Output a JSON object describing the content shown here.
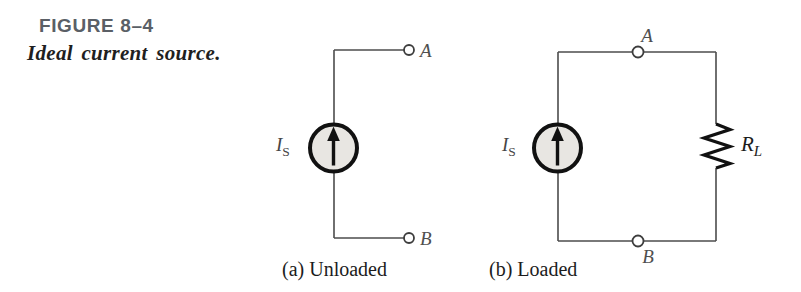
{
  "figure": {
    "label": "FIGURE 8–4",
    "title": "Ideal current source."
  },
  "circuits": {
    "a": {
      "caption": "(a) Unloaded",
      "terminal_top": "A",
      "terminal_bottom": "B",
      "source_label": {
        "main": "I",
        "sub": "S"
      }
    },
    "b": {
      "caption": "(b) Loaded",
      "terminal_top": "A",
      "terminal_bottom": "B",
      "source_label": {
        "main": "I",
        "sub": "S"
      },
      "resistor_label": {
        "main": "R",
        "sub": "L"
      }
    }
  },
  "colors": {
    "figure_label": "#5a5f66",
    "figure_title": "#1f1f1f",
    "wire": "#4d4d4d",
    "symbol": "#111111",
    "source_fill": "#e8e6e2",
    "node_label": "#4f4f4f",
    "caption": "#1c1c1c"
  }
}
